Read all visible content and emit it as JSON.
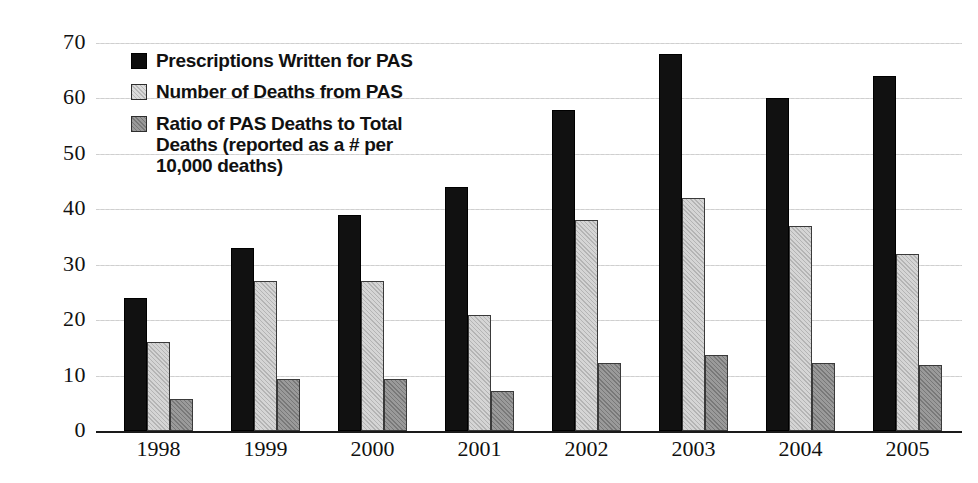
{
  "chart_data": {
    "type": "bar",
    "title": "",
    "subtitle": "",
    "xlabel": "",
    "ylabel": "",
    "ylim": [
      0,
      70
    ],
    "ytick_values": [
      70,
      60,
      50,
      40,
      30,
      20,
      10,
      0
    ],
    "ytick_labels": [
      "70",
      "60",
      "50",
      "40",
      "30",
      "20",
      "10",
      "0"
    ],
    "grid": true,
    "grid_axis": "y",
    "legend_position": "upper-left-inside",
    "categories": [
      "1998",
      "1999",
      "2000",
      "2001",
      "2002",
      "2003",
      "2004",
      "2005"
    ],
    "series": [
      {
        "name": "Prescriptions Written for PAS",
        "color": "#111111",
        "values": [
          24,
          33,
          39,
          44,
          58,
          68,
          60,
          64
        ]
      },
      {
        "name": "Number of Deaths from PAS",
        "color": "#d5d5d5",
        "values": [
          16,
          27,
          27,
          21,
          38,
          42,
          37,
          32
        ]
      },
      {
        "name": "Ratio of PAS Deaths to Total Deaths (reported as a # per 10,000 deaths)",
        "color": "#9a9a9a",
        "values": [
          5.7,
          9.3,
          9.3,
          7.3,
          12.3,
          13.7,
          12.3,
          12.0
        ]
      }
    ]
  },
  "legend": {
    "items": [
      {
        "swatch": "legend-swatch-black",
        "label": "Prescriptions Written for PAS"
      },
      {
        "swatch": "legend-swatch-light-gray",
        "label": "Number of Deaths from PAS"
      },
      {
        "swatch": "legend-swatch-dark-gray",
        "label": "Ratio of PAS Deaths to Total\nDeaths (reported as a # per\n10,000 deaths)"
      }
    ]
  },
  "colors": {
    "series_black": "#111111",
    "series_light_gray": "#d5d5d5",
    "series_dark_gray": "#9a9a9a",
    "axis": "#1a1a1a",
    "grid": "#d9d9d9",
    "text": "#111111",
    "background": "#ffffff"
  }
}
